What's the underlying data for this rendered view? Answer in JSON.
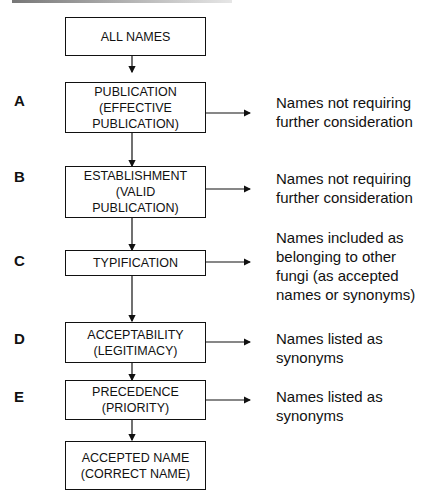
{
  "diagram": {
    "steps": [
      {
        "id": "start",
        "letter": "",
        "label": "ALL NAMES",
        "note": ""
      },
      {
        "id": "A",
        "letter": "A",
        "label": "PUBLICATION\n(EFFECTIVE\nPUBLICATION)",
        "note": "Names not requiring\nfurther consideration"
      },
      {
        "id": "B",
        "letter": "B",
        "label": "ESTABLISHMENT\n(VALID\nPUBLICATION)",
        "note": "Names not requiring\nfurther consideration"
      },
      {
        "id": "C",
        "letter": "C",
        "label": "TYPIFICATION",
        "note": "Names included as\nbelonging to other\nfungi (as accepted\nnames or synonyms)"
      },
      {
        "id": "D",
        "letter": "D",
        "label": "ACCEPTABILITY\n(LEGITIMACY)",
        "note": "Names listed as\nsynonyms"
      },
      {
        "id": "E",
        "letter": "E",
        "label": "PRECEDENCE\n(PRIORITY)",
        "note": "Names listed as\nsynonyms"
      },
      {
        "id": "end",
        "letter": "",
        "label": "ACCEPTED NAME\n(CORRECT NAME)",
        "note": ""
      }
    ]
  }
}
